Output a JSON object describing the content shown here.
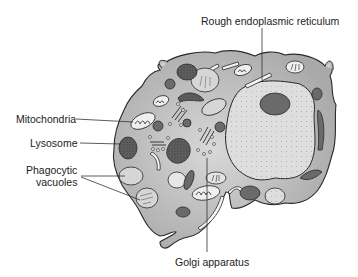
{
  "diagram": {
    "labels": {
      "rer": "Rough endoplasmic reticulum",
      "mitochondria": "Mitochondria",
      "lysosome": "Lysosome",
      "phagocytic_line1": "Phagocytic",
      "phagocytic_line2": "vacuoles",
      "golgi": "Golgi apparatus"
    },
    "colors": {
      "cytoplasm": "#b9b9b9",
      "nucleus": "#dcdcdc",
      "dark_organelle": "#6a6a6a",
      "outline": "#2a2a2a",
      "background": "#ffffff"
    }
  }
}
